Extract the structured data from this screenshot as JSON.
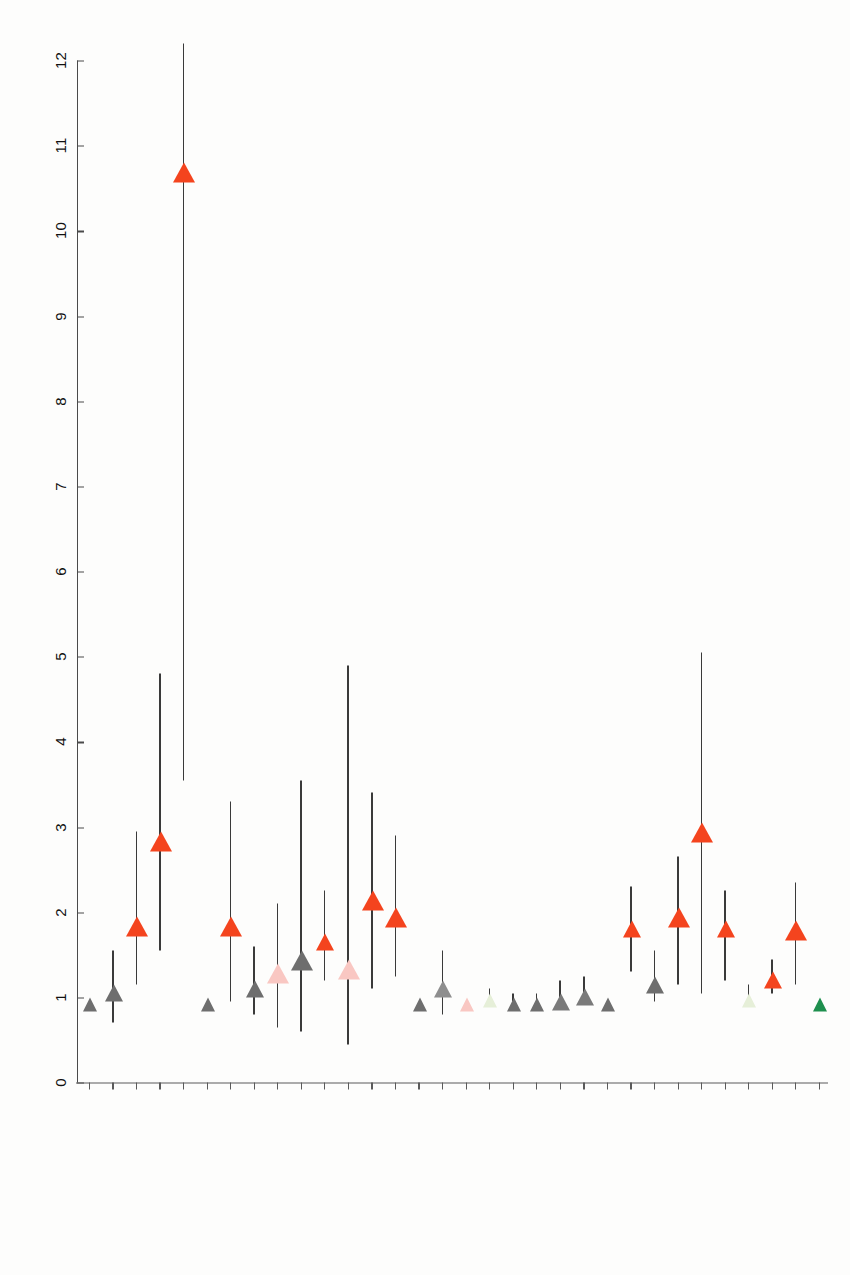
{
  "chart_data": {
    "type": "scatter",
    "subtype": "forest-plot",
    "title": "",
    "xlabel": "",
    "ylabel": "",
    "xlim": [
      0,
      12
    ],
    "xticks": [
      0,
      1,
      2,
      3,
      4,
      5,
      6,
      7,
      8,
      9,
      10,
      11,
      12
    ],
    "xtick_labels": [
      "0",
      "1",
      "2",
      "3",
      "4",
      "5",
      "6",
      "7",
      "8",
      "9",
      "10",
      "11",
      "12"
    ],
    "grid": false,
    "legend": "none",
    "axis_orientation": "x-axis along bottom, labels rotated 180 degrees (scanned sideways page)",
    "reference_line_value": 1,
    "marker_shape": "left-pointing-triangle",
    "categories": [
      "bis 25 Jahre (Ref.)",
      "mehr als 25 – 35 Jahre",
      "mehr als 35 – 45 Jahre",
      "mehr als 45 – 55 Jahre",
      "mehr als 55 Jahre",
      "Offene Gruppenarbeit (Ref.)",
      "Halboffene Gruppenarbeit",
      "Geschlossene Gruppenarbeit",
      "Erst- und Zweitkraft",
      "Hochschulabschluss",
      "berufsbegleitende Zusatzausbildung",
      "keine Weiterbildungsunterstützung",
      "Gute strukturelle Rahmenbedingungen",
      "Schlechte strukturelle Rahmenbedingungen",
      "Mittlere strukturelle Rahmenbedingungen (Ref.)",
      "Wünsch. weniger o. kürzer zu arbeiten",
      "Überstunden (pro gemachter Überstunde)",
      "Teamklima",
      "Handlungsspielraum",
      "Führungsqualität",
      "Viel Bewegung auf der Arbeit",
      "Körperlich anstrengende Arbeit",
      "AVEM Typ G (Gesund) (Ref.)",
      "AVEM Typ S (Schonung)",
      "AVEM Risikotyp A (Anstrengung)",
      "AVEM Risikotyp B (Burnout)",
      "Aktuelles Rauchen",
      "Soziale Unterstützung",
      "Private Belastung",
      "Übergewicht/ Adipositas",
      "Mehr als 2 Stunden Sport pro Woche",
      "Behinderungsindex"
    ],
    "points": [
      {
        "label": "bis 25 Jahre (Ref.)",
        "value": 1.0,
        "ci_low": 1.0,
        "ci_high": 1.0,
        "color": "#6e6e6e",
        "significant": false
      },
      {
        "label": "mehr als 25 – 35 Jahre",
        "value": 1.15,
        "ci_low": 0.7,
        "ci_high": 1.55,
        "color": "#6e6e6e",
        "significant": false
      },
      {
        "label": "mehr als 35 – 45 Jahre",
        "value": 1.95,
        "ci_low": 1.15,
        "ci_high": 2.95,
        "color": "#f4441e",
        "significant": true
      },
      {
        "label": "mehr als 45 – 55 Jahre",
        "value": 2.95,
        "ci_low": 1.55,
        "ci_high": 4.8,
        "color": "#f4441e",
        "significant": true
      },
      {
        "label": "mehr als 55 Jahre",
        "value": 10.8,
        "ci_low": 3.55,
        "ci_high": 12.2,
        "color": "#f4441e",
        "significant": true
      },
      {
        "label": "Offene Gruppenarbeit (Ref.)",
        "value": 1.0,
        "ci_low": 1.0,
        "ci_high": 1.0,
        "color": "#6e6e6e",
        "significant": false
      },
      {
        "label": "Halboffene Gruppenarbeit",
        "value": 1.95,
        "ci_low": 0.95,
        "ci_high": 3.3,
        "color": "#f4441e",
        "significant": true
      },
      {
        "label": "Geschlossene Gruppenarbeit",
        "value": 1.2,
        "ci_low": 0.8,
        "ci_high": 1.6,
        "color": "#6e6e6e",
        "significant": false
      },
      {
        "label": "Erst- und Zweitkraft",
        "value": 1.4,
        "ci_low": 0.65,
        "ci_high": 2.1,
        "color": "#f9c7c2",
        "significant": false
      },
      {
        "label": "Hochschulabschluss",
        "value": 1.55,
        "ci_low": 0.6,
        "ci_high": 3.55,
        "color": "#6e6e6e",
        "significant": false
      },
      {
        "label": "berufsbegleitende Zusatzausbildung",
        "value": 1.75,
        "ci_low": 1.2,
        "ci_high": 2.25,
        "color": "#f4441e",
        "significant": true
      },
      {
        "label": "keine Weiterbildungsunterstützung",
        "value": 1.45,
        "ci_low": 0.45,
        "ci_high": 4.9,
        "color": "#f9c7c2",
        "significant": false
      },
      {
        "label": "Gute strukturelle Rahmenbedingungen",
        "value": 2.25,
        "ci_low": 1.1,
        "ci_high": 3.4,
        "color": "#f4441e",
        "significant": true
      },
      {
        "label": "Schlechte strukturelle Rahmenbedingungen",
        "value": 2.05,
        "ci_low": 1.25,
        "ci_high": 2.9,
        "color": "#f4441e",
        "significant": true
      },
      {
        "label": "Mittlere strukturelle Rahmenbedingungen (Ref.)",
        "value": 1.0,
        "ci_low": 1.0,
        "ci_high": 1.0,
        "color": "#6e6e6e",
        "significant": false
      },
      {
        "label": "Wünsch. weniger o. kürzer zu arbeiten",
        "value": 1.2,
        "ci_low": 0.8,
        "ci_high": 1.55,
        "color": "#8e8e8e",
        "significant": false
      },
      {
        "label": "Überstunden (pro gemachter Überstunde)",
        "value": 1.0,
        "ci_low": 1.0,
        "ci_high": 1.0,
        "color": "#f9c7c2",
        "significant": false
      },
      {
        "label": "Teamklima",
        "value": 1.05,
        "ci_low": 1.0,
        "ci_high": 1.1,
        "color": "#e6efd8",
        "significant": false
      },
      {
        "label": "Handlungsspielraum",
        "value": 1.0,
        "ci_low": 0.95,
        "ci_high": 1.05,
        "color": "#6e6e6e",
        "significant": false
      },
      {
        "label": "Führungsqualität",
        "value": 1.0,
        "ci_low": 0.95,
        "ci_high": 1.05,
        "color": "#6e6e6e",
        "significant": false
      },
      {
        "label": "Viel Bewegung auf der Arbeit",
        "value": 1.05,
        "ci_low": 0.9,
        "ci_high": 1.2,
        "color": "#7a7a7a",
        "significant": false
      },
      {
        "label": "Körperlich anstrengende Arbeit",
        "value": 1.1,
        "ci_low": 0.95,
        "ci_high": 1.25,
        "color": "#7a7a7a",
        "significant": false
      },
      {
        "label": "AVEM Typ G (Gesund) (Ref.)",
        "value": 1.0,
        "ci_low": 1.0,
        "ci_high": 1.0,
        "color": "#6e6e6e",
        "significant": false
      },
      {
        "label": "AVEM Typ S (Schonung)",
        "value": 1.9,
        "ci_low": 1.3,
        "ci_high": 2.3,
        "color": "#f4441e",
        "significant": true
      },
      {
        "label": "AVEM Risikotyp A (Anstrengung)",
        "value": 1.25,
        "ci_low": 0.95,
        "ci_high": 1.55,
        "color": "#6e6e6e",
        "significant": false
      },
      {
        "label": "AVEM Risikotyp B (Burnout)",
        "value": 2.05,
        "ci_low": 1.15,
        "ci_high": 2.65,
        "color": "#f4441e",
        "significant": true
      },
      {
        "label": "Aktuelles Rauchen",
        "value": 3.05,
        "ci_low": 1.05,
        "ci_high": 5.05,
        "color": "#f4441e",
        "significant": true
      },
      {
        "label": "Soziale Unterstützung",
        "value": 1.9,
        "ci_low": 1.2,
        "ci_high": 2.25,
        "color": "#f4441e",
        "significant": true
      },
      {
        "label": "Private Belastung",
        "value": 1.05,
        "ci_low": 1.0,
        "ci_high": 1.15,
        "color": "#e6efd8",
        "significant": false
      },
      {
        "label": "Übergewicht/ Adipositas",
        "value": 1.3,
        "ci_low": 1.05,
        "ci_high": 1.45,
        "color": "#f4441e",
        "significant": true
      },
      {
        "label": "Mehr als 2 Stunden Sport pro Woche",
        "value": 1.9,
        "ci_low": 1.15,
        "ci_high": 2.35,
        "color": "#f4441e",
        "significant": true
      },
      {
        "label": "Behinderungsindex",
        "value": 1.0,
        "ci_low": 1.0,
        "ci_high": 1.0,
        "color": "#1e8f4e",
        "significant": true
      }
    ],
    "colors": {
      "significant_red": "#f4441e",
      "significant_green": "#1e8f4e",
      "neutral_grey": "#6e6e6e",
      "pale_pink": "#f9c7c2",
      "pale_green": "#e6efd8",
      "axis": "#4a4a4a",
      "background": "#fdfdfc"
    }
  }
}
